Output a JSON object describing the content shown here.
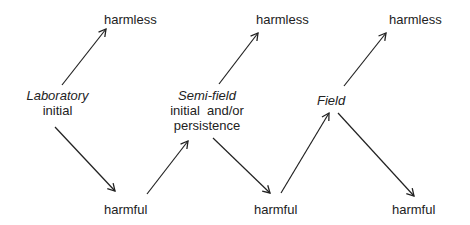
{
  "diagram": {
    "nodes": {
      "laboratory": {
        "title": "Laboratory",
        "subtitle": "initial"
      },
      "semifield": {
        "title": "Semi-field",
        "line2": "initial  and/or",
        "line3": "persistence"
      },
      "field": {
        "title": "Field"
      },
      "lab_harmless": "harmless",
      "lab_harmful": "harmful",
      "semi_harmless": "harmless",
      "semi_harmful": "harmful",
      "field_harmless": "harmless",
      "field_harmful": "harmful"
    },
    "edges": [
      {
        "from": "Laboratory initial",
        "to": "harmless"
      },
      {
        "from": "Laboratory initial",
        "to": "harmful"
      },
      {
        "from": "harmful",
        "to": "Semi-field"
      },
      {
        "from": "Semi-field",
        "to": "harmless"
      },
      {
        "from": "Semi-field",
        "to": "harmful"
      },
      {
        "from": "harmful",
        "to": "Field"
      },
      {
        "from": "Field",
        "to": "harmless"
      },
      {
        "from": "Field",
        "to": "harmful"
      }
    ],
    "colors": {
      "line": "#222222",
      "text": "#222222",
      "background": "#ffffff"
    }
  }
}
